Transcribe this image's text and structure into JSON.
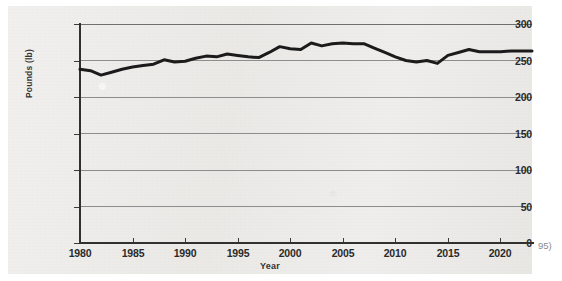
{
  "page": {
    "margin_note": "95)",
    "background_color": "#ffffff",
    "figure_background_color": "#eeedeb"
  },
  "chart_data": {
    "type": "line",
    "title": "",
    "subtitle": "",
    "xlabel": "Year",
    "ylabel": "Pounds (lb)",
    "xlim": [
      1980,
      2023
    ],
    "ylim": [
      0,
      300
    ],
    "grid": true,
    "legend": "none",
    "line_color": "#1b1b1b",
    "line_width_px": 3,
    "y_ticks": [
      300,
      250,
      200,
      150,
      100,
      50,
      0
    ],
    "y_tick_labels": [
      "300",
      "250",
      "200",
      "150",
      "100",
      "50",
      "0"
    ],
    "x_ticks": [
      1980,
      1985,
      1990,
      1995,
      2000,
      2005,
      2010,
      2015,
      2020
    ],
    "x_tick_labels": [
      "1980",
      "1985",
      "1990",
      "1995",
      "2000",
      "2005",
      "2010",
      "2015",
      "2020"
    ],
    "x": [
      1980,
      1981,
      1982,
      1983,
      1984,
      1985,
      1986,
      1987,
      1988,
      1989,
      1990,
      1991,
      1992,
      1993,
      1994,
      1995,
      1996,
      1997,
      1998,
      1999,
      2000,
      2001,
      2002,
      2003,
      2004,
      2005,
      2006,
      2007,
      2008,
      2009,
      2010,
      2011,
      2012,
      2013,
      2014,
      2015,
      2016,
      2017,
      2018,
      2019,
      2020,
      2021,
      2022,
      2023
    ],
    "values": [
      238,
      236,
      230,
      234,
      238,
      241,
      243,
      245,
      251,
      248,
      249,
      253,
      256,
      255,
      259,
      257,
      255,
      254,
      261,
      269,
      266,
      265,
      274,
      270,
      273,
      274,
      273,
      273,
      267,
      261,
      255,
      250,
      248,
      250,
      246,
      257,
      261,
      265,
      262,
      262,
      262,
      263,
      263,
      263
    ],
    "series": [
      {
        "name": "Pounds per person",
        "values": [
          238,
          236,
          230,
          234,
          238,
          241,
          243,
          245,
          251,
          248,
          249,
          253,
          256,
          255,
          259,
          257,
          255,
          254,
          261,
          269,
          266,
          265,
          274,
          270,
          273,
          274,
          273,
          273,
          267,
          261,
          255,
          250,
          248,
          250,
          246,
          257,
          261,
          265,
          262,
          262,
          262,
          263,
          263,
          263
        ]
      }
    ],
    "annotations": []
  }
}
